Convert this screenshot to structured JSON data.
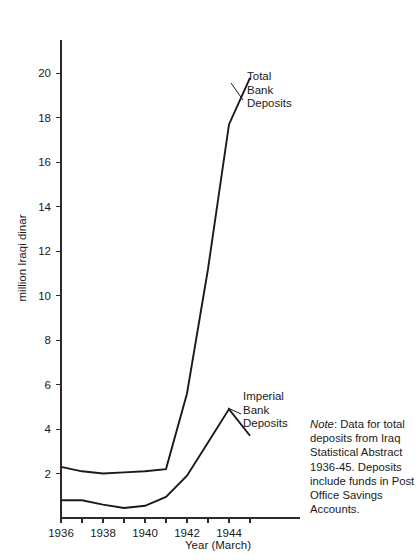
{
  "chart_data": {
    "type": "line",
    "title": "",
    "xlabel": "Year (March)",
    "ylabel": "million Iraqi dinar",
    "xlim": [
      1936,
      1945
    ],
    "ylim": [
      0,
      21.5
    ],
    "grid": false,
    "legend_position": "inline-annotations",
    "x": [
      1936,
      1937,
      1938,
      1939,
      1940,
      1941,
      1942,
      1943,
      1944,
      1945
    ],
    "xticks": [
      1936,
      1937,
      1938,
      1939,
      1940,
      1941,
      1942,
      1943,
      1944,
      1945
    ],
    "xtick_labels": [
      "1936",
      "",
      "1938",
      "",
      "1940",
      "",
      "1942",
      "",
      "1944",
      ""
    ],
    "yticks": [
      2,
      4,
      6,
      8,
      10,
      12,
      14,
      16,
      18,
      20
    ],
    "ytick_labels": [
      "2",
      "4",
      "6",
      "8",
      "10",
      "12",
      "14",
      "16",
      "18",
      "20"
    ],
    "series": [
      {
        "name": "Total Bank Deposits",
        "values": [
          2.3,
          2.1,
          2.0,
          2.05,
          2.1,
          2.2,
          5.6,
          11.2,
          17.7,
          19.8
        ],
        "annotation": "Total\nBank\nDeposits"
      },
      {
        "name": "Imperial Bank Deposits",
        "values": [
          0.8,
          0.8,
          0.6,
          0.45,
          0.55,
          0.95,
          1.9,
          3.4,
          4.9,
          3.7
        ],
        "annotation": "Imperial\nBank\nDeposits"
      }
    ],
    "note_label": "Note",
    "note_text": ": Data for total deposits from Iraq Statistical Abstract 1936-45. Deposits include funds in Post Office Savings Accounts.",
    "colors": {
      "line": "#1a1a1a",
      "axis": "#2b2b2b",
      "background": "#ffffff"
    }
  }
}
